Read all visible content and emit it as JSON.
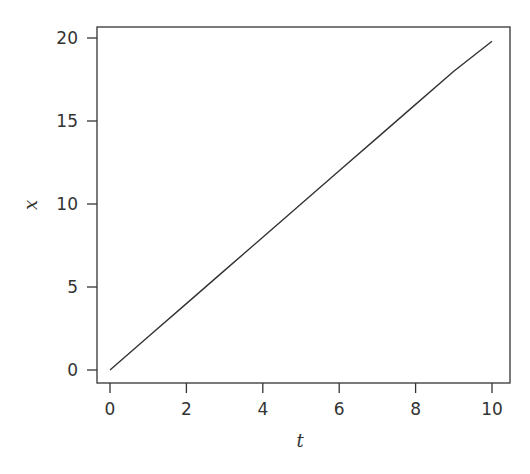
{
  "chart_data": {
    "type": "line",
    "title": "",
    "xlabel": "t",
    "ylabel": "x",
    "xlim": [
      -0.35,
      10.5
    ],
    "ylim": [
      -0.8,
      20.7
    ],
    "xticks": [
      0,
      2,
      4,
      6,
      8,
      10
    ],
    "yticks": [
      0,
      5,
      10,
      15,
      20
    ],
    "xtick_labels": [
      "0",
      "2",
      "4",
      "6",
      "8",
      "10"
    ],
    "ytick_labels": [
      "0",
      "5",
      "10",
      "15",
      "20"
    ],
    "grid": false,
    "legend": null,
    "series": [
      {
        "name": "x(t)",
        "color": "#333333",
        "x": [
          0,
          1,
          2,
          3,
          4,
          5,
          6,
          7,
          8,
          9,
          10
        ],
        "y": [
          0,
          2,
          4,
          6,
          8,
          10,
          12,
          14,
          16,
          18,
          19.8
        ]
      }
    ]
  },
  "colors": {
    "line": "#333333",
    "axis": "#333333",
    "background": "#ffffff"
  }
}
